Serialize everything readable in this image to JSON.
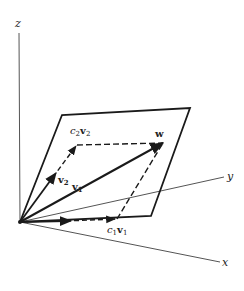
{
  "diagram": {
    "axes": {
      "z": {
        "label": "z"
      },
      "y": {
        "label": "y"
      },
      "x": {
        "label": "x"
      }
    },
    "vectors": {
      "v1": {
        "label": "v",
        "sub": "1"
      },
      "v2": {
        "label": "v",
        "sub": "2"
      },
      "w": {
        "label": "w"
      },
      "c1v1": {
        "coef": "c",
        "coef_sub": "1",
        "label": "v",
        "sub": "1"
      },
      "c2v2": {
        "coef": "c",
        "coef_sub": "2",
        "label": "v",
        "sub": "2"
      }
    },
    "colors": {
      "line": "#1a1a1a",
      "axis": "#555555",
      "background": "#ffffff"
    }
  }
}
